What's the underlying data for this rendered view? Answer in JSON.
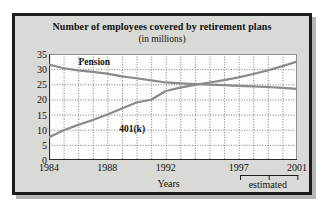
{
  "figure": {
    "title_main": "Number of employees covered by retirement plans",
    "title_sub": "(in millions)",
    "xaxis_title": "Years",
    "estimated_label": "estimated"
  },
  "chart_data": {
    "type": "line",
    "title": "Number of employees covered by retirement plans",
    "subtitle": "(in millions)",
    "xlabel": "Years",
    "ylabel": "",
    "units": "millions of employees",
    "xlim": [
      1984,
      2001
    ],
    "ylim": [
      0,
      35
    ],
    "grid": true,
    "grid_style": "dotted",
    "legend": "inline-labels",
    "x_tick_labels": [
      "1984",
      "1988",
      "1992",
      "1997",
      "2001"
    ],
    "x_tick_values": [
      1984,
      1988,
      1992,
      1997,
      2001
    ],
    "y_tick_labels": [
      "0",
      "5",
      "10",
      "15",
      "20",
      "25",
      "30",
      "35"
    ],
    "y_tick_values": [
      0,
      5,
      10,
      15,
      20,
      25,
      30,
      35
    ],
    "x": [
      1984,
      1985,
      1986,
      1987,
      1988,
      1989,
      1990,
      1991,
      1992,
      1993,
      1994,
      1995,
      1996,
      1997,
      1998,
      1999,
      2000,
      2001
    ],
    "series": [
      {
        "name": "Pension",
        "label_x": 1987.1,
        "label_y": 32.2,
        "color": "#8a8a8a",
        "values": [
          31.5,
          30.3,
          29.6,
          29.1,
          28.5,
          27.6,
          27.0,
          26.3,
          25.6,
          25.3,
          25.1,
          24.9,
          24.7,
          24.5,
          24.3,
          24.1,
          23.8,
          23.5
        ]
      },
      {
        "name": "401(k)",
        "label_x": 1989.7,
        "label_y": 10.3,
        "color": "#8a8a8a",
        "values": [
          7.5,
          9.8,
          11.6,
          13.2,
          15.0,
          17.0,
          19.0,
          19.9,
          22.8,
          23.9,
          24.8,
          25.6,
          26.4,
          27.3,
          28.4,
          29.6,
          31.0,
          32.5
        ]
      }
    ],
    "annotations": [
      {
        "name": "estimated-bracket",
        "text": "estimated",
        "x_start": 1997,
        "x_end": 2001,
        "x_mid": 1999
      }
    ]
  }
}
